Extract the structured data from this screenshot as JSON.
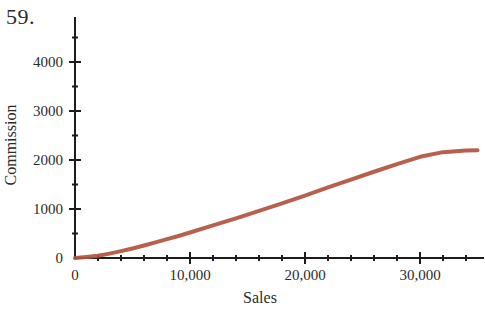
{
  "problem": {
    "number_label": "59."
  },
  "chart_data": {
    "type": "line",
    "title": "",
    "xlabel": "Sales",
    "ylabel": "Commission",
    "xlim": [
      0,
      35000
    ],
    "ylim": [
      0,
      4600
    ],
    "grid": false,
    "legend": null,
    "x_ticks_major": [
      0,
      10000,
      20000,
      30000
    ],
    "x_tick_labels": [
      "0",
      "10,000",
      "20,000",
      "30,000"
    ],
    "x_ticks_minor": [
      2000,
      4000,
      6000,
      8000,
      12000,
      14000,
      16000,
      18000,
      22000,
      24000,
      26000,
      28000,
      32000,
      34000
    ],
    "y_ticks_major": [
      0,
      1000,
      2000,
      3000,
      4000
    ],
    "y_tick_labels": [
      "0",
      "1000",
      "2000",
      "3000",
      "4000"
    ],
    "y_ticks_minor": [
      500,
      1500,
      2500,
      3500,
      4500
    ],
    "series": [
      {
        "name": "Commission",
        "color": "#b25540",
        "x": [
          0,
          1000,
          2000,
          3000,
          4000,
          5000,
          6000,
          7000,
          8000,
          9000,
          10000,
          12000,
          14000,
          16000,
          18000,
          20000,
          22000,
          24000,
          26000,
          28000,
          30000,
          32000,
          34000,
          35000
        ],
        "values": [
          0,
          20,
          45,
          90,
          140,
          195,
          255,
          320,
          385,
          450,
          520,
          665,
          810,
          960,
          1115,
          1275,
          1440,
          1600,
          1760,
          1915,
          2065,
          2160,
          2195,
          2200
        ]
      }
    ]
  }
}
